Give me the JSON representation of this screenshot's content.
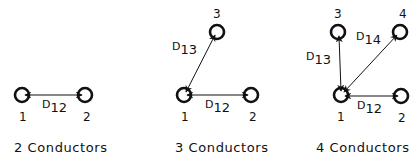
{
  "colors": {
    "ink": "#111111",
    "background": "#ffffff"
  },
  "panels": [
    {
      "caption": "2 Conductors",
      "conductors": [
        {
          "id": "1",
          "label": "1"
        },
        {
          "id": "2",
          "label": "2"
        }
      ],
      "distances": [
        {
          "label": "D",
          "subscript": "12"
        }
      ]
    },
    {
      "caption": "3 Conductors",
      "conductors": [
        {
          "id": "1",
          "label": "1"
        },
        {
          "id": "2",
          "label": "2"
        },
        {
          "id": "3",
          "label": "3"
        }
      ],
      "distances": [
        {
          "label": "D",
          "subscript": "13"
        },
        {
          "label": "D",
          "subscript": "12"
        }
      ]
    },
    {
      "caption": "4 Conductors",
      "conductors": [
        {
          "id": "1",
          "label": "1"
        },
        {
          "id": "2",
          "label": "2"
        },
        {
          "id": "3",
          "label": "3"
        },
        {
          "id": "4",
          "label": "4"
        }
      ],
      "distances": [
        {
          "label": "D",
          "subscript": "13"
        },
        {
          "label": "D",
          "subscript": "14"
        },
        {
          "label": "D",
          "subscript": "12"
        }
      ]
    }
  ]
}
